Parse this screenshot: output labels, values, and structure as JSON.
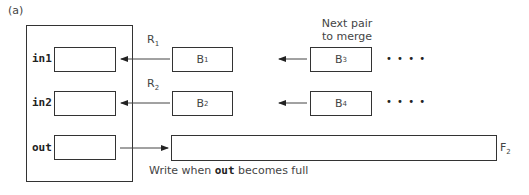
{
  "figure": {
    "panel_label": "(a)",
    "memory": {
      "buffers": [
        {
          "name": "in1"
        },
        {
          "name": "in2"
        },
        {
          "name": "out"
        }
      ]
    },
    "runs": {
      "row1": {
        "pointer": "R",
        "pointer_sub": "1",
        "current": "B",
        "current_sub": "1",
        "next": "B",
        "next_sub": "3",
        "ellipsis": "• • • •"
      },
      "row2": {
        "pointer": "R",
        "pointer_sub": "2",
        "current": "B",
        "current_sub": "2",
        "next": "B",
        "next_sub": "4",
        "ellipsis": "• • • •"
      }
    },
    "next_pair_label_line1": "Next pair",
    "next_pair_label_line2": "to merge",
    "output_file": {
      "name": "F",
      "sub": "2"
    },
    "write_note_prefix": "Write when ",
    "write_note_code": "out",
    "write_note_suffix": " becomes full"
  }
}
